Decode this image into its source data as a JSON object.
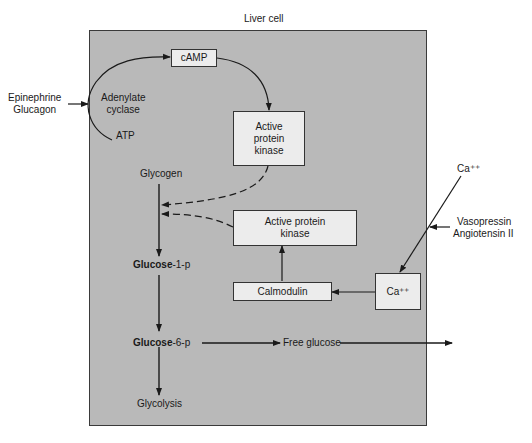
{
  "title": "Liver cell",
  "external": {
    "hormones_left": [
      "Epinephrine",
      "Glucagon"
    ],
    "calcium_outside": "Ca⁺⁺",
    "hormones_right": [
      "Vasopressin",
      "Angiotensin II"
    ]
  },
  "camp_pathway": {
    "enzyme": [
      "Adenylate",
      "cyclase"
    ],
    "substrate": "ATP",
    "second_messenger": "cAMP",
    "kinase": [
      "Active",
      "protein",
      "kinase"
    ]
  },
  "calcium_pathway": {
    "calcium_inside": "Ca⁺⁺",
    "calmodulin": "Calmodulin",
    "kinase": [
      "Active protein",
      "kinase"
    ]
  },
  "glycogen_pathway": {
    "glycogen": "Glycogen",
    "glucose_1p": {
      "bold": "Glucose",
      "rest": "-1-p"
    },
    "glucose_6p": {
      "bold": "Glucose",
      "rest": "-6-p"
    },
    "glycolysis": "Glycolysis",
    "free_glucose": "Free glucose"
  },
  "colors": {
    "cell_fill": "#b9b9b9",
    "box_fill": "#ececec",
    "line": "#1a1a1a"
  }
}
